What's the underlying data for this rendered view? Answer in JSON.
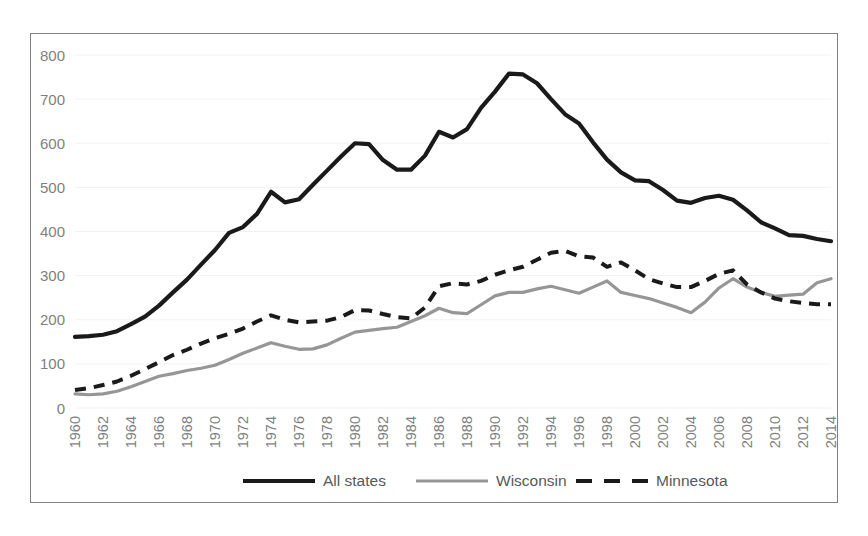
{
  "chart_data": {
    "type": "line",
    "title": "",
    "xlabel": "",
    "ylabel": "",
    "ylim": [
      0,
      800
    ],
    "ytick_values": [
      0,
      100,
      200,
      300,
      400,
      500,
      600,
      700,
      800
    ],
    "ytick_labels": [
      "0",
      "100",
      "200",
      "300",
      "400",
      "500",
      "600",
      "700",
      "800"
    ],
    "grid": true,
    "grid_axis": "y",
    "legend_position": "bottom",
    "xtick_rotation": 90,
    "x": [
      1960,
      1961,
      1962,
      1963,
      1964,
      1965,
      1966,
      1967,
      1968,
      1969,
      1970,
      1971,
      1972,
      1973,
      1974,
      1975,
      1976,
      1977,
      1978,
      1979,
      1980,
      1981,
      1982,
      1983,
      1984,
      1985,
      1986,
      1987,
      1988,
      1989,
      1990,
      1991,
      1992,
      1993,
      1994,
      1995,
      1996,
      1997,
      1998,
      1999,
      2000,
      2001,
      2002,
      2003,
      2004,
      2005,
      2006,
      2007,
      2008,
      2009,
      2010,
      2011,
      2012,
      2013,
      2014
    ],
    "xtick_labels": [
      "1960",
      "1962",
      "1964",
      "1966",
      "1968",
      "1970",
      "1972",
      "1974",
      "1976",
      "1978",
      "1980",
      "1982",
      "1984",
      "1986",
      "1988",
      "1990",
      "1992",
      "1994",
      "1996",
      "1998",
      "2000",
      "2002",
      "2004",
      "2006",
      "2008",
      "2010",
      "2012",
      "2014"
    ],
    "series": [
      {
        "name": "All states",
        "color": "#1a1a1a",
        "style": "solid",
        "width": 4.2,
        "values": [
          161,
          163,
          166,
          174,
          190,
          207,
          232,
          262,
          291,
          325,
          358,
          397,
          410,
          440,
          490,
          466,
          473,
          506,
          538,
          570,
          600,
          598,
          562,
          540,
          540,
          572,
          626,
          613,
          632,
          680,
          717,
          758,
          756,
          736,
          700,
          666,
          645,
          602,
          563,
          534,
          516,
          514,
          494,
          470,
          465,
          476,
          481,
          472,
          448,
          421,
          407,
          392,
          390,
          383,
          378
        ]
      },
      {
        "name": "Wisconsin",
        "color": "#969696",
        "style": "solid",
        "width": 3.2,
        "values": [
          32,
          30,
          32,
          38,
          48,
          60,
          72,
          78,
          85,
          90,
          97,
          110,
          124,
          136,
          148,
          140,
          133,
          134,
          143,
          158,
          172,
          176,
          180,
          183,
          196,
          209,
          226,
          216,
          214,
          234,
          254,
          262,
          262,
          270,
          276,
          268,
          260,
          274,
          288,
          262,
          255,
          248,
          238,
          228,
          216,
          240,
          272,
          293,
          274,
          262,
          253,
          256,
          258,
          284,
          293
        ]
      },
      {
        "name": "Minnesota",
        "color": "#1a1a1a",
        "style": "dashed",
        "width": 4.0,
        "values": [
          41,
          45,
          52,
          60,
          73,
          88,
          104,
          120,
          132,
          146,
          158,
          168,
          180,
          196,
          210,
          200,
          194,
          196,
          198,
          206,
          222,
          221,
          213,
          206,
          203,
          228,
          276,
          283,
          280,
          288,
          302,
          312,
          320,
          336,
          352,
          356,
          344,
          341,
          320,
          330,
          312,
          292,
          282,
          274,
          274,
          288,
          304,
          312,
          280,
          262,
          248,
          242,
          238,
          235,
          235
        ]
      }
    ],
    "legend": [
      {
        "label": "All states",
        "color": "#1a1a1a",
        "style": "solid"
      },
      {
        "label": "Wisconsin",
        "color": "#969696",
        "style": "solid"
      },
      {
        "label": "Minnesota",
        "color": "#1a1a1a",
        "style": "dashed"
      }
    ]
  }
}
